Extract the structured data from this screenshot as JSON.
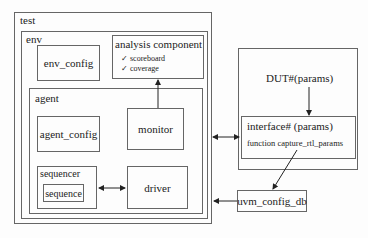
{
  "diagram": {
    "test": {
      "label": "test"
    },
    "env": {
      "label": "env"
    },
    "env_config": {
      "label": "env_config"
    },
    "analysis": {
      "label": "analysis component",
      "items": [
        "✓ scoreboard",
        "✓ coverage"
      ]
    },
    "agent": {
      "label": "agent"
    },
    "agent_config": {
      "label": "agent_config"
    },
    "monitor": {
      "label": "monitor"
    },
    "sequencer": {
      "label": "sequencer"
    },
    "sequence": {
      "label": "sequence"
    },
    "driver": {
      "label": "driver"
    },
    "dut_group": {
      "dut": {
        "label": "DUT#(params)"
      },
      "interface": {
        "label": "interface# (params)",
        "function": "function capture_rtl_params"
      }
    },
    "uvm_config_db": {
      "label": "uvm_config_db"
    }
  }
}
